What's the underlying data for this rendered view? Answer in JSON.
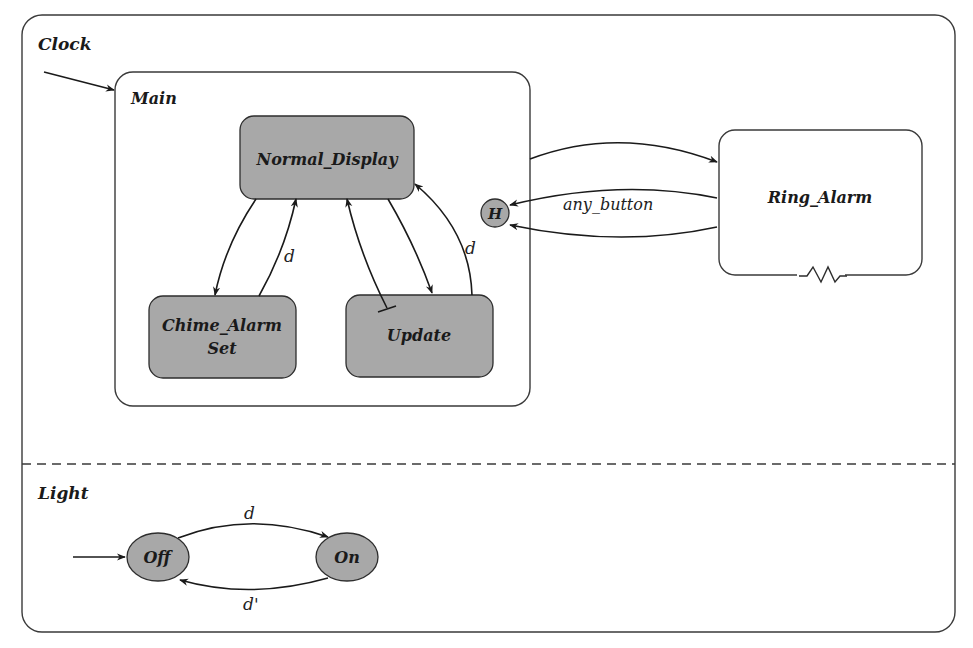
{
  "diagram": {
    "type": "statechart",
    "colors": {
      "state_fill": "#a8a8a8",
      "stroke": "#2d2d2d",
      "background": "#ffffff"
    },
    "clock": {
      "label": "Clock",
      "main": {
        "label": "Main",
        "states": {
          "normal_display": "Normal_Display",
          "chime_alarm_set_line1": "Chime_Alarm",
          "chime_alarm_set_line2": "Set",
          "update": "Update"
        },
        "transitions": {
          "chime_to_normal": "d",
          "update_to_normal": "d"
        }
      },
      "history": "H",
      "ring_alarm": {
        "label": "Ring_Alarm",
        "transition_label": "any_button"
      }
    },
    "light": {
      "label": "Light",
      "states": {
        "off": "Off",
        "on": "On"
      },
      "transitions": {
        "off_to_on": "d",
        "on_to_off": "d'"
      }
    }
  }
}
